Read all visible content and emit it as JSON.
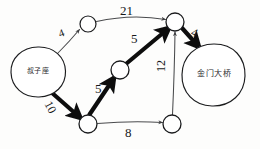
{
  "diagram": {
    "style": "hand-sketched pencil on paper",
    "ink_color": "#1b1c1e",
    "thick_edge_color": "#0d0e10",
    "thin_edge_color": "#4a4b4d",
    "paper_color": "#fdfdfc"
  },
  "nodes": [
    {
      "id": "source",
      "label": "叔子座",
      "shape": "ellipse",
      "cx": 38,
      "cy": 72,
      "rx": 27,
      "ry": 25,
      "highlighted": false
    },
    {
      "id": "upper",
      "label": "",
      "shape": "circle",
      "cx": 88,
      "cy": 24,
      "rx": 8,
      "ry": 8,
      "highlighted": false
    },
    {
      "id": "hub",
      "label": "",
      "shape": "circle",
      "cx": 175,
      "cy": 22,
      "rx": 9,
      "ry": 9,
      "highlighted": true
    },
    {
      "id": "middle",
      "label": "",
      "shape": "circle",
      "cx": 120,
      "cy": 70,
      "rx": 9,
      "ry": 9,
      "highlighted": true
    },
    {
      "id": "lower_left",
      "label": "",
      "shape": "circle",
      "cx": 88,
      "cy": 124,
      "rx": 9,
      "ry": 9,
      "highlighted": true
    },
    {
      "id": "lower_right",
      "label": "",
      "shape": "circle",
      "cx": 172,
      "cy": 124,
      "rx": 9,
      "ry": 9,
      "highlighted": false
    },
    {
      "id": "destination",
      "label": "金门大桥",
      "shape": "ellipse",
      "cx": 213,
      "cy": 75,
      "rx": 32,
      "ry": 31,
      "highlighted": false
    }
  ],
  "edges": [
    {
      "id": "e-source-upper",
      "from": "source",
      "to": "upper",
      "weight": "4",
      "thick": false,
      "label_x": 57,
      "label_y": 29,
      "label_rotate": -20,
      "font_size": 11
    },
    {
      "id": "e-upper-hub",
      "from": "upper",
      "to": "hub",
      "weight": "21",
      "thick": false,
      "label_x": 120,
      "label_y": 6,
      "label_rotate": 0,
      "font_size": 13
    },
    {
      "id": "e-source-lowerleft",
      "from": "source",
      "to": "lower_left",
      "weight": "10",
      "thick": true,
      "label_x": 53,
      "label_y": 102,
      "label_rotate": 62,
      "font_size": 12
    },
    {
      "id": "e-lowerleft-middle",
      "from": "lower_left",
      "to": "middle",
      "weight": "5",
      "thick": true,
      "label_x": 95,
      "label_y": 84,
      "label_rotate": 0,
      "font_size": 13
    },
    {
      "id": "e-middle-hub",
      "from": "middle",
      "to": "hub",
      "weight": "5",
      "thick": true,
      "label_x": 131,
      "label_y": 33,
      "label_rotate": 0,
      "font_size": 13
    },
    {
      "id": "e-hub-destination",
      "from": "hub",
      "to": "destination",
      "weight": "4",
      "thick": true,
      "label_x": 194,
      "label_y": 28,
      "label_rotate": 22,
      "font_size": 12
    },
    {
      "id": "e-lowerleft-lowerright",
      "from": "lower_left",
      "to": "lower_right",
      "weight": "8",
      "thick": false,
      "label_x": 125,
      "label_y": 126,
      "label_rotate": 0,
      "font_size": 13
    },
    {
      "id": "e-lowerright-hub",
      "from": "lower_right",
      "to": "hub",
      "weight": "12",
      "thick": false,
      "label_x": 158,
      "label_y": 66,
      "label_rotate": -90,
      "font_size": 12
    }
  ],
  "node_labels": {
    "source_text": "叔子座",
    "destination_text": "金门大桥",
    "source_font_size": 7,
    "destination_font_size": 8
  }
}
